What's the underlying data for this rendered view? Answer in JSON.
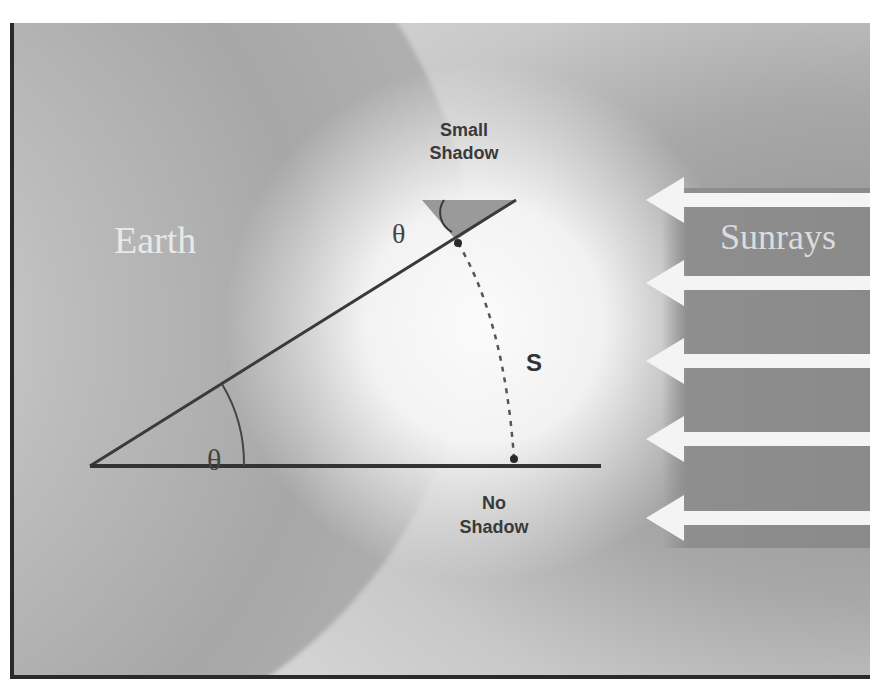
{
  "diagram": {
    "labels": {
      "earth": "Earth",
      "sunrays": "Sunrays",
      "small_shadow": [
        "Small",
        "Shadow"
      ],
      "no_shadow": [
        "No",
        "Shadow"
      ],
      "arc_length": "S",
      "angle_top": "θ",
      "angle_center": "θ"
    },
    "elements": {
      "sunray_arrows_count": 6,
      "sunray_direction": "left",
      "arc": "dashed arc between the two gnomon bases",
      "angle_relation": "shadow angle at gnomon equals central angle θ"
    },
    "colors": {
      "background_light": "#d6d6d6",
      "earth_gray": "#a7a7a7",
      "rays_panel": "#8a8a8a",
      "arrow": "#f5f5f5",
      "line": "#3a3a3a",
      "border": "#2a2a2a"
    }
  }
}
